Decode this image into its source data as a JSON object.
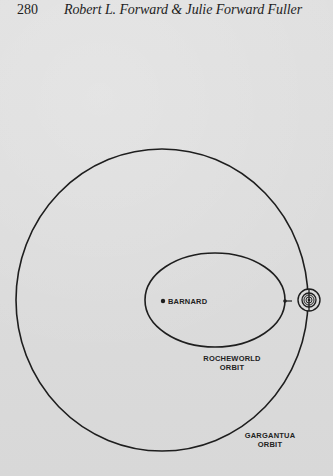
{
  "header": {
    "page_number": "280",
    "title": "Robert L. Forward & Julie Forward Fuller"
  },
  "diagram": {
    "labels": {
      "star": "BARNARD",
      "inner_orbit_line1": "ROCHEWORLD",
      "inner_orbit_line2": "ORBIT",
      "outer_orbit_line1": "GARGANTUA",
      "outer_orbit_line2": "ORBIT"
    },
    "colors": {
      "background": "#dcdcdc",
      "ink": "#1e1e1e"
    }
  }
}
